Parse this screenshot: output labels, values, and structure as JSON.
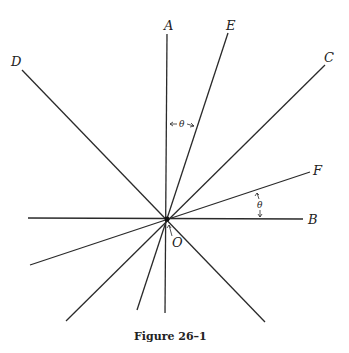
{
  "figure": {
    "caption": "Figure 26–1",
    "origin_label": "O",
    "angle_label": "θ",
    "center": [
      167,
      219
    ],
    "rays": [
      {
        "label": "A",
        "end": [
          167,
          34
        ],
        "opposite": [
          165,
          313
        ],
        "label_pos": [
          166,
          30
        ]
      },
      {
        "label": "E",
        "end": [
          228,
          33
        ],
        "opposite": [
          137,
          310
        ],
        "label_pos": [
          230,
          30
        ]
      },
      {
        "label": "C",
        "end": [
          325,
          65
        ],
        "opposite": [
          66,
          321
        ],
        "label_pos": [
          328,
          61
        ]
      },
      {
        "label": "D",
        "end": [
          22,
          70
        ],
        "opposite": [
          265,
          322
        ],
        "label_pos": [
          12,
          67
        ]
      },
      {
        "label": "F",
        "end": [
          310,
          172
        ],
        "opposite": [
          30,
          265
        ],
        "label_pos": [
          318,
          172
        ]
      },
      {
        "label": "B",
        "end": [
          303,
          219
        ],
        "opposite": [
          28,
          218
        ],
        "label_pos": [
          311,
          224
        ]
      }
    ],
    "angle_annotations": [
      {
        "between": [
          "A",
          "E"
        ],
        "label": "θ",
        "label_pos": [
          182,
          127
        ]
      },
      {
        "between": [
          "B",
          "F"
        ],
        "label": "θ",
        "label_pos": [
          258,
          207
        ]
      }
    ]
  }
}
